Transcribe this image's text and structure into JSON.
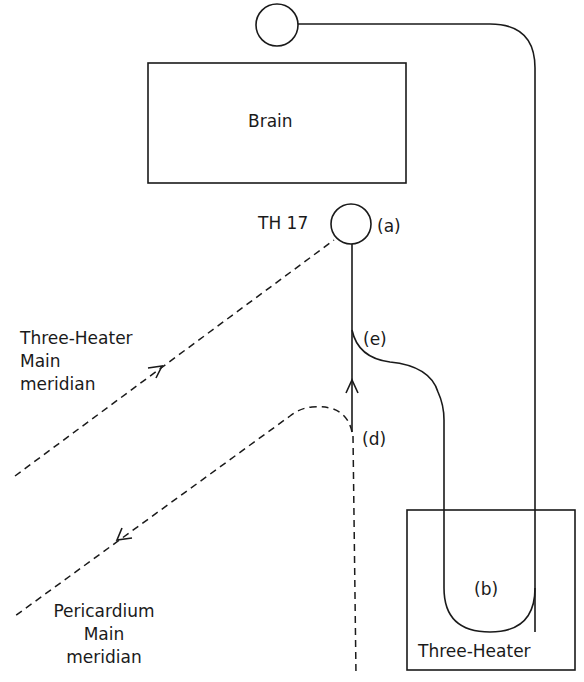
{
  "diagram": {
    "nodes": {
      "brain": {
        "label": "Brain"
      },
      "th17": {
        "label": "TH 17",
        "marker": "(a)"
      },
      "three_heater_organ": {
        "label": "Three-Heater",
        "marker": "(b)"
      },
      "top_point": {
        "label": ""
      }
    },
    "markers": {
      "d": "(d)",
      "e": "(e)"
    },
    "meridians": {
      "three_heater": {
        "line1": "Three-Heater",
        "line2": "Main",
        "line3": "meridian",
        "direction": "toward TH 17"
      },
      "pericardium": {
        "line1": "Pericardium",
        "line2": "Main",
        "line3": "meridian",
        "direction": "away from (d)"
      }
    },
    "colors": {
      "ink": "#1a1a1a",
      "background": "#ffffff"
    }
  }
}
